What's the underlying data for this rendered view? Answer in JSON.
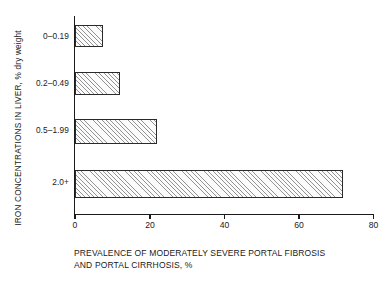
{
  "chart_data": {
    "type": "bar",
    "orientation": "horizontal",
    "title": "",
    "xlabel": "PREVALENCE OF MODERATELY SEVERE PORTAL FIBROSIS AND PORTAL CIRRHOSIS, %",
    "xlabel_line1": "PREVALENCE OF MODERATELY SEVERE PORTAL FIBROSIS",
    "xlabel_line2": "AND PORTAL CIRRHOSIS, %",
    "ylabel": "IRON CONCENTRATIONS IN LIVER, % dry weight",
    "categories": [
      "0–0.19",
      "0.2–0.49",
      "0.5–1.99",
      "2.0+"
    ],
    "values": [
      7.5,
      12,
      22,
      72
    ],
    "xlim": [
      0,
      80
    ],
    "xticks": [
      0,
      20,
      40,
      60,
      80
    ],
    "xticklabels": [
      "0",
      "20",
      "40",
      "60",
      "80"
    ],
    "grid": false,
    "legend": null,
    "bar_fill": "diagonal-hatch",
    "bar_edge_color": "#2a2a2a",
    "background_color": "#ffffff"
  },
  "bars": [
    {
      "category": "0–0.19",
      "value": 7.5
    },
    {
      "category": "0.2–0.49",
      "value": 12
    },
    {
      "category": "0.5–1.99",
      "value": 22
    },
    {
      "category": "2.0+",
      "value": 72
    }
  ]
}
